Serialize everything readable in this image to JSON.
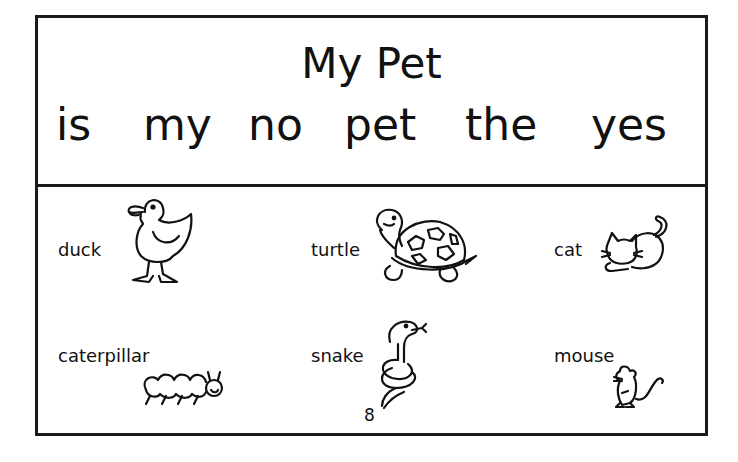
{
  "title": "My Pet",
  "sight_words": [
    "is",
    "my",
    "no",
    "pet",
    "the",
    "yes"
  ],
  "animals": [
    {
      "label": "duck",
      "icon": "duck-icon"
    },
    {
      "label": "turtle",
      "icon": "turtle-icon"
    },
    {
      "label": "cat",
      "icon": "cat-icon"
    },
    {
      "label": "caterpillar",
      "icon": "caterpillar-icon"
    },
    {
      "label": "snake",
      "icon": "snake-icon"
    },
    {
      "label": "mouse",
      "icon": "mouse-icon"
    }
  ],
  "page_number": "8"
}
